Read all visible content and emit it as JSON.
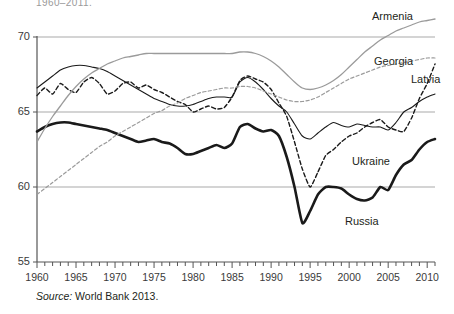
{
  "figure": {
    "title_fragment": "1960–2011.",
    "source_prefix": "Source:",
    "source_text": "World Bank 2013."
  },
  "axes": {
    "y_ticks": [
      "70",
      "65",
      "60",
      "55"
    ],
    "x_ticks": [
      "1960",
      "1965",
      "1970",
      "1975",
      "1980",
      "1985",
      "1990",
      "1995",
      "2000",
      "2005",
      "2010"
    ]
  },
  "series_labels": {
    "armenia": "Armenia",
    "georgia": "Georgia",
    "latvia": "Latvia",
    "ukraine": "Ukraine",
    "russia": "Russia"
  },
  "colors": {
    "black": "#1a1a1a",
    "gray": "#9b9b9b",
    "grid": "#a9a9a9",
    "axis": "#555555",
    "text": "#231f20"
  },
  "chart_data": {
    "type": "line",
    "xlabel": "",
    "ylabel": "",
    "xlim": [
      1960,
      2011
    ],
    "ylim": [
      55,
      70
    ],
    "grid": true,
    "gridlines_y": [
      70,
      65,
      60
    ],
    "legend": "inline-labels",
    "x": [
      1960,
      1961,
      1962,
      1963,
      1964,
      1965,
      1966,
      1967,
      1968,
      1969,
      1970,
      1971,
      1972,
      1973,
      1974,
      1975,
      1976,
      1977,
      1978,
      1979,
      1980,
      1981,
      1982,
      1983,
      1984,
      1985,
      1986,
      1987,
      1988,
      1989,
      1990,
      1991,
      1992,
      1993,
      1994,
      1995,
      1996,
      1997,
      1998,
      1999,
      2000,
      2001,
      2002,
      2003,
      2004,
      2005,
      2006,
      2007,
      2008,
      2009,
      2010,
      2011
    ],
    "series": [
      {
        "name": "Ukraine",
        "style": "thin-solid-black",
        "values": [
          66.6,
          67.0,
          67.4,
          67.8,
          68.0,
          68.1,
          68.1,
          68.0,
          67.9,
          67.7,
          67.4,
          67.1,
          66.8,
          66.5,
          66.2,
          65.9,
          65.7,
          65.5,
          65.4,
          65.4,
          65.5,
          65.7,
          65.9,
          66.0,
          66.0,
          66.0,
          67.0,
          67.3,
          67.0,
          66.5,
          65.9,
          65.4,
          65.0,
          64.2,
          63.4,
          63.2,
          63.6,
          64.0,
          64.3,
          64.1,
          64.0,
          64.2,
          64.1,
          64.0,
          64.0,
          63.8,
          64.3,
          65.0,
          65.3,
          65.7,
          66.0,
          66.2
        ]
      },
      {
        "name": "Latvia",
        "style": "black-dashed",
        "values": [
          66.1,
          66.6,
          66.2,
          66.9,
          66.5,
          66.3,
          67.0,
          67.3,
          66.9,
          66.2,
          66.4,
          66.9,
          67.0,
          66.6,
          66.8,
          66.5,
          66.3,
          66.0,
          65.7,
          65.5,
          65.0,
          65.2,
          65.4,
          65.2,
          65.3,
          66.0,
          67.1,
          67.4,
          67.2,
          67.0,
          66.5,
          65.6,
          64.7,
          63.0,
          61.2,
          60.0,
          61.0,
          62.1,
          62.5,
          63.0,
          63.4,
          63.6,
          64.0,
          64.3,
          64.5,
          64.0,
          63.8,
          63.7,
          64.6,
          65.9,
          66.9,
          68.2
        ]
      },
      {
        "name": "Russia",
        "style": "thick-solid-black",
        "values": [
          63.7,
          64.0,
          64.2,
          64.3,
          64.3,
          64.2,
          64.1,
          64.0,
          63.9,
          63.8,
          63.6,
          63.4,
          63.2,
          63.0,
          63.1,
          63.2,
          63.0,
          62.9,
          62.6,
          62.2,
          62.2,
          62.4,
          62.6,
          62.8,
          62.6,
          62.9,
          64.0,
          64.2,
          63.9,
          63.7,
          63.8,
          63.4,
          62.0,
          60.0,
          57.6,
          58.4,
          59.5,
          60.0,
          60.0,
          59.9,
          59.5,
          59.2,
          59.1,
          59.3,
          60.0,
          59.8,
          60.8,
          61.5,
          61.8,
          62.5,
          63.0,
          63.2
        ]
      },
      {
        "name": "Armenia",
        "style": "gray-solid",
        "values": [
          63.0,
          63.9,
          64.7,
          65.4,
          66.1,
          66.7,
          67.2,
          67.6,
          67.9,
          68.2,
          68.4,
          68.6,
          68.7,
          68.8,
          68.9,
          68.9,
          68.9,
          68.9,
          68.9,
          68.9,
          68.9,
          68.9,
          68.9,
          68.9,
          68.9,
          68.9,
          69.0,
          69.0,
          68.9,
          68.7,
          68.4,
          68.0,
          67.5,
          67.0,
          66.6,
          66.5,
          66.6,
          66.8,
          67.1,
          67.5,
          68.0,
          68.5,
          69.0,
          69.4,
          69.8,
          70.1,
          70.4,
          70.6,
          70.8,
          71.0,
          71.1,
          71.2
        ]
      },
      {
        "name": "Georgia",
        "style": "gray-dashed",
        "values": [
          59.5,
          59.9,
          60.3,
          60.7,
          61.1,
          61.5,
          61.9,
          62.3,
          62.7,
          63.0,
          63.4,
          63.7,
          64.0,
          64.3,
          64.6,
          64.9,
          65.1,
          65.4,
          65.6,
          65.9,
          66.1,
          66.3,
          66.4,
          66.5,
          66.6,
          66.6,
          66.7,
          66.7,
          66.6,
          66.4,
          66.2,
          66.0,
          65.8,
          65.7,
          65.7,
          65.8,
          66.0,
          66.3,
          66.6,
          66.9,
          67.2,
          67.4,
          67.6,
          67.8,
          68.0,
          68.1,
          68.2,
          68.3,
          68.4,
          68.5,
          68.6,
          68.6
        ]
      }
    ]
  }
}
